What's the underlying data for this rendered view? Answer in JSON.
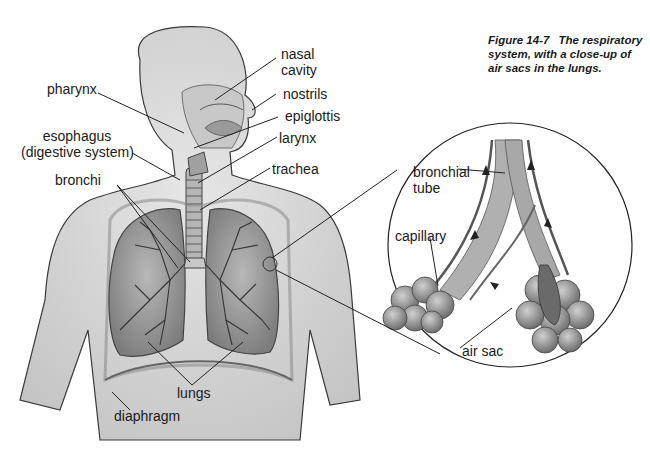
{
  "figure": {
    "caption_number": "Figure 14-7",
    "caption_text": "The respiratory system, with a close-up of air sacs in the lungs."
  },
  "labels": {
    "nasal_cavity_1": "nasal",
    "nasal_cavity_2": "cavity",
    "pharynx": "pharynx",
    "nostrils": "nostrils",
    "epiglottis": "epiglottis",
    "esophagus_1": "esophagus",
    "esophagus_2": "(digestive system)",
    "larynx": "larynx",
    "trachea": "trachea",
    "bronchi": "bronchi",
    "lungs": "lungs",
    "diaphragm": "diaphragm",
    "bronchial_tube_1": "bronchial",
    "bronchial_tube_2": "tube",
    "capillary": "capillary",
    "air_sac": "air sac"
  },
  "colors": {
    "body_fill": "#d9d9d9",
    "body_stroke": "#3a3a3a",
    "lung_fill": "#9a9a9a",
    "airway": "#7a7a7a",
    "leader_line": "#222222",
    "background": "#ffffff"
  }
}
